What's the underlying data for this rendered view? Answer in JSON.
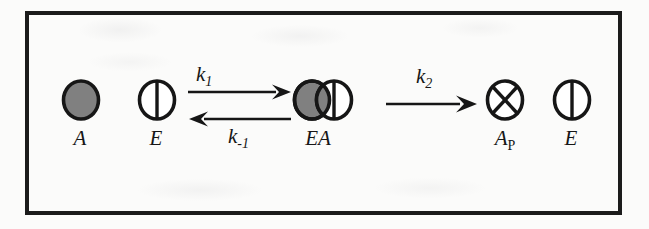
{
  "figure": {
    "type": "reaction-scheme",
    "frame_color": "#1b1b1b",
    "background_color": "#fbfbfa",
    "species": [
      {
        "id": "substrate-a",
        "label": "A",
        "sublabel": "",
        "icon": "filled-gray-circle",
        "fill": "#808080",
        "stroke": "#161616"
      },
      {
        "id": "enzyme-e-left",
        "label": "E",
        "sublabel": "",
        "icon": "circle-with-vertical-line",
        "fill": "#ffffff",
        "stroke": "#161616"
      },
      {
        "id": "complex-ea",
        "label": "EA",
        "sublabel": "",
        "icon": "overlapping-gray-circle-and-split-circle",
        "fill": "#808080",
        "stroke": "#161616"
      },
      {
        "id": "product-ap",
        "label": "A",
        "sublabel": "P",
        "icon": "circle-with-x-cross",
        "fill": "#ffffff",
        "stroke": "#161616"
      },
      {
        "id": "enzyme-e-right",
        "label": "E",
        "sublabel": "",
        "icon": "circle-with-vertical-line",
        "fill": "#ffffff",
        "stroke": "#161616"
      }
    ],
    "reactions": [
      {
        "id": "reaction-1",
        "kind": "reversible",
        "forward_rate_base": "k",
        "forward_rate_sub": "1",
        "reverse_rate_base": "k",
        "reverse_rate_sub": "-1",
        "forward_direction": "right",
        "reverse_direction": "left"
      },
      {
        "id": "reaction-2",
        "kind": "irreversible",
        "forward_rate_base": "k",
        "forward_rate_sub": "2",
        "forward_direction": "right"
      }
    ]
  }
}
